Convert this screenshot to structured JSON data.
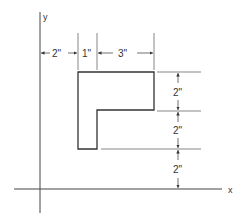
{
  "diagram": {
    "type": "dimensioned L-shaped cross-section on x-y axes",
    "axes": {
      "x_label": "x",
      "y_label": "y"
    },
    "horizontal_dimensions": [
      {
        "label": "2\"",
        "meaning": "distance from y-axis to left edge of shape"
      },
      {
        "label": "1\"",
        "meaning": "width of vertical leg"
      },
      {
        "label": "3\"",
        "meaning": "width of horizontal flange beyond leg"
      }
    ],
    "vertical_dimensions": [
      {
        "label": "2\"",
        "meaning": "height of top flange"
      },
      {
        "label": "2\"",
        "meaning": "remaining height of vertical leg"
      },
      {
        "label": "2\"",
        "meaning": "distance from bottom of shape to x-axis"
      }
    ],
    "colors": {
      "line": "#333333",
      "background": "#ffffff"
    }
  }
}
